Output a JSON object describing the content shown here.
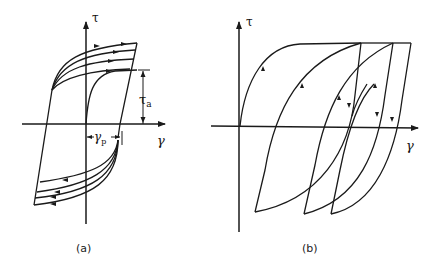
{
  "figure": {
    "panels": [
      {
        "id": "a",
        "caption": "(a)",
        "axes": {
          "y_label": "τ",
          "x_label": "γ"
        },
        "annotations": {
          "tau_a": "τ",
          "tau_a_sub": "a",
          "gamma_p": "γ",
          "gamma_p_sub": "p"
        },
        "description": "Cyclic stress-strain loops with increasing stress amplitude; initial loading curve from origin, τa marked as stress amplitude, γp marked as plastic strain"
      },
      {
        "id": "b",
        "caption": "(b)",
        "axes": {
          "y_label": "τ",
          "x_label": "γ"
        },
        "description": "Ratcheting hysteresis loops shifting to the right with cycling"
      }
    ]
  }
}
